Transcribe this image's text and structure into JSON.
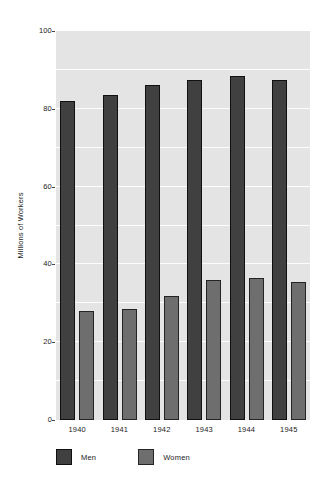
{
  "chart_data": {
    "type": "bar",
    "title": "",
    "xlabel": "",
    "ylabel": "Millions of Workers",
    "categories": [
      "1940",
      "1941",
      "1942",
      "1943",
      "1944",
      "1945"
    ],
    "series": [
      {
        "name": "Men",
        "color": "#404040",
        "values": [
          82,
          83.5,
          86,
          87.5,
          88.5,
          87.5
        ]
      },
      {
        "name": "Women",
        "color": "#6e6e6e",
        "values": [
          28,
          28.5,
          32,
          36,
          36.5,
          35.5
        ]
      }
    ],
    "ylim": [
      0,
      100
    ],
    "ytick_labels": [
      "0",
      "20",
      "40",
      "60",
      "80",
      "100"
    ],
    "ytick_values": [
      0,
      20,
      40,
      60,
      80,
      100
    ],
    "gridlines": [
      10,
      20,
      30,
      40,
      50,
      60,
      70,
      80,
      90
    ],
    "grid": true,
    "grid_color": "#fdfdfd",
    "plot_background": "#e4e4e4",
    "legend_position": "below-axis",
    "legend": [
      "Men",
      "Women"
    ]
  }
}
